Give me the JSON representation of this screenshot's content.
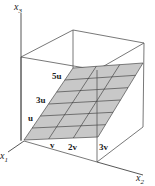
{
  "diagram": {
    "axes": {
      "x1_label": "x",
      "x1_sub": "1",
      "x2_label": "x",
      "x2_sub": "2",
      "x3_label": "x",
      "x3_sub": "3"
    },
    "plane_labels": {
      "u": "u",
      "three_u": "3u",
      "five_u": "5u",
      "v": "v",
      "two_v": "2v",
      "three_v": "3v"
    },
    "colors": {
      "plane_fill": "#c8c8c8",
      "grid_line": "#333333",
      "box_line": "#555555",
      "axis_line": "#444444"
    },
    "grid": {
      "v_divisions": 3,
      "u_divisions": 6
    }
  }
}
